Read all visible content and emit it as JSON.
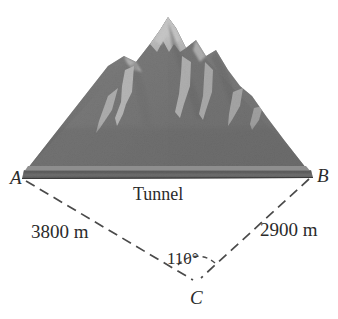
{
  "figure": {
    "background_color": "#ffffff",
    "width": 338,
    "height": 319
  },
  "scene": {
    "mountain": {
      "name": "mountain",
      "body_color": "#6e6e6e",
      "shadow_color": "#5a5a5a",
      "snow_color": "#f2f2f2",
      "base_band_color": "#4a4a4a",
      "base_top_color": "#8a8a8a",
      "snow_streak_count": 6
    },
    "tunnel": {
      "label": "Tunnel"
    }
  },
  "triangle": {
    "type": "line-diagram",
    "line_style": "dashed",
    "line_color": "#4a4a4a",
    "vertices": [
      {
        "name": "A",
        "label": "A",
        "x": 22,
        "y": 178,
        "position": "left-base"
      },
      {
        "name": "B",
        "label": "B",
        "x": 313,
        "y": 176,
        "position": "right-base"
      },
      {
        "name": "C",
        "label": "C",
        "x": 197,
        "y": 282,
        "position": "bottom-apex"
      }
    ],
    "sides": [
      {
        "name": "AC",
        "label": "3800 m",
        "value": 3800,
        "unit": "m",
        "from": "A",
        "to": "C"
      },
      {
        "name": "BC",
        "label": "2900 m",
        "value": 2900,
        "unit": "m",
        "from": "B",
        "to": "C"
      },
      {
        "name": "AB",
        "label": "Tunnel",
        "from": "A",
        "to": "B"
      }
    ],
    "angles": [
      {
        "name": "C",
        "label": "110°",
        "value": 110,
        "unit": "degrees",
        "at_vertex": "C"
      }
    ]
  },
  "labels": {
    "vertex_a": "A",
    "vertex_b": "B",
    "vertex_c": "C",
    "tunnel": "Tunnel",
    "side_ac": "3800 m",
    "side_bc": "2900 m",
    "angle_c": "110°"
  }
}
